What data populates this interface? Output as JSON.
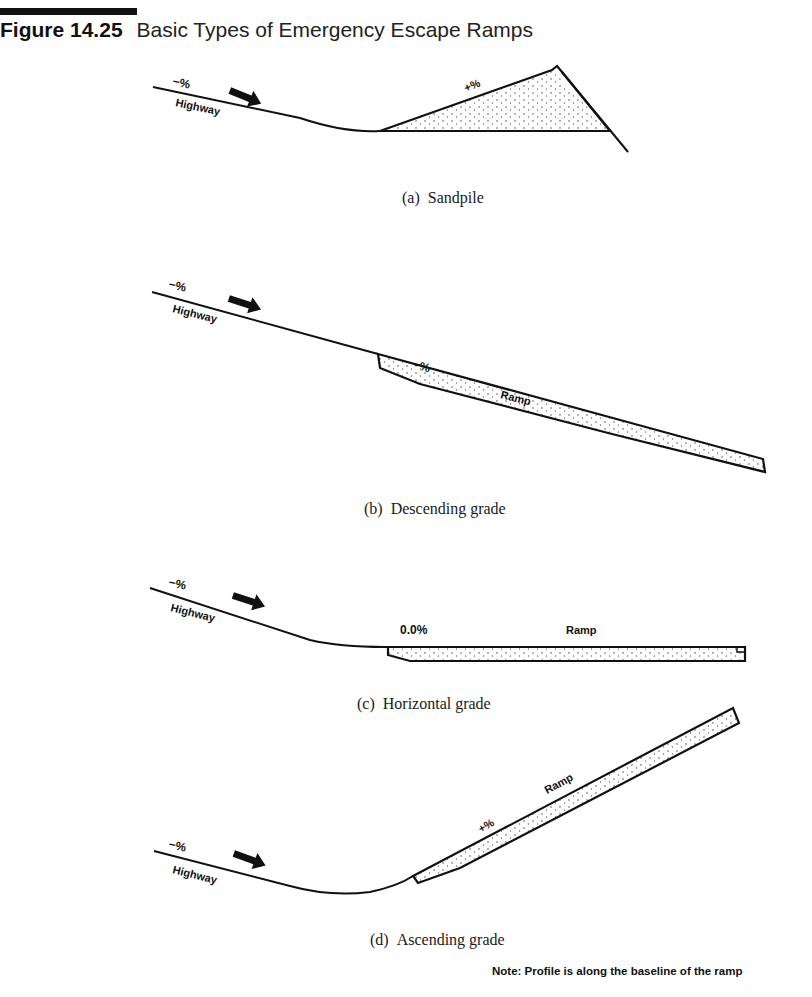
{
  "figure": {
    "number": "Figure 14.25",
    "title": "Basic Types of Emergency Escape Ramps"
  },
  "panels": [
    {
      "id": "a",
      "letter": "(a)",
      "caption": "Sandpile",
      "labels": {
        "highway_grade": "−%",
        "highway": "Highway",
        "ramp_grade": "+%"
      }
    },
    {
      "id": "b",
      "letter": "(b)",
      "caption": "Descending grade",
      "labels": {
        "highway_grade": "−%",
        "highway": "Highway",
        "ramp_grade": "−%",
        "ramp": "Ramp"
      }
    },
    {
      "id": "c",
      "letter": "(c)",
      "caption": "Horizontal grade",
      "labels": {
        "highway_grade": "−%",
        "highway": "Highway",
        "ramp_grade": "0.0%",
        "ramp": "Ramp"
      }
    },
    {
      "id": "d",
      "letter": "(d)",
      "caption": "Ascending grade",
      "labels": {
        "highway_grade": "−%",
        "highway": "Highway",
        "ramp_grade": "+%",
        "ramp": "Ramp"
      }
    }
  ],
  "note": "Note:  Profile is along the baseline of the ramp",
  "colors": {
    "ink": "#111111",
    "background": "#ffffff",
    "fill_dots": "#555555"
  }
}
